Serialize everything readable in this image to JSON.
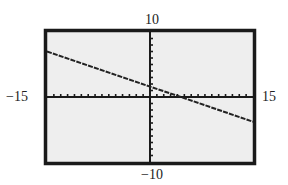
{
  "window": {
    "xmin": -15,
    "xmax": 15,
    "ymin": -10,
    "ymax": 10,
    "xscl": 1,
    "yscl": 1
  },
  "labels": {
    "xmin": "−15",
    "xmax": "15",
    "ymin": "−10",
    "ymax": "10"
  },
  "colors": {
    "screen": "#eeeeee",
    "frame": "#1a1a1a",
    "line": "#222222"
  },
  "chart_data": {
    "type": "line",
    "title": "",
    "xlabel": "",
    "ylabel": "",
    "xlim": [
      -15,
      15
    ],
    "ylim": [
      -10,
      10
    ],
    "grid": false,
    "legend": null,
    "axis_labels": {
      "left": "−15",
      "right": "15",
      "top": "10",
      "bottom": "−10"
    },
    "ticks": {
      "x_scale": 1,
      "y_scale": 1
    },
    "series": [
      {
        "name": "graph",
        "x": [
          -15,
          0,
          4.5,
          15
        ],
        "y": [
          7.0,
          1.6,
          0.0,
          -3.8
        ]
      }
    ]
  }
}
